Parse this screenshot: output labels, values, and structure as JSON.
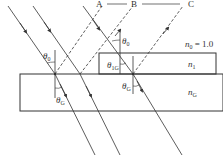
{
  "diagram": {
    "type": "refraction-thin-film",
    "points": {
      "A": "A",
      "B": "B",
      "C": "C"
    },
    "media": {
      "air": {
        "symbol": "n",
        "subscript": "0",
        "eq": "= 1.0"
      },
      "film": {
        "symbol": "n",
        "subscript": "1"
      },
      "glass": {
        "symbol": "n",
        "subscript": "G"
      }
    },
    "angles": {
      "incident_left": {
        "symbol": "θ",
        "subscript": "0"
      },
      "incident_right": {
        "symbol": "θ",
        "subscript": "0"
      },
      "film_refracted": {
        "symbol": "θ",
        "subscript": "1G"
      },
      "glass_left": {
        "symbol": "θ",
        "subscript": "G"
      },
      "glass_right": {
        "symbol": "θ",
        "subscript": "G"
      }
    },
    "colors": {
      "line": "#333333",
      "background": "#ffffff"
    }
  }
}
